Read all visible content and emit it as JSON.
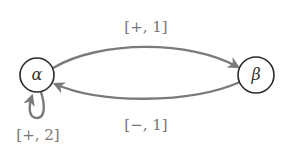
{
  "diagram": {
    "type": "state-transition",
    "nodes": [
      {
        "id": "alpha",
        "label": "α"
      },
      {
        "id": "beta",
        "label": "β"
      }
    ],
    "edges": [
      {
        "from": "alpha",
        "to": "beta",
        "label": "[+, 1]"
      },
      {
        "from": "beta",
        "to": "alpha",
        "label": "[−, 1]"
      },
      {
        "from": "alpha",
        "to": "alpha",
        "label": "[+, 2]"
      }
    ],
    "colors": {
      "node_stroke": "#2a2a2a",
      "edge_stroke": "#7a7a7a",
      "label_text": "#777777"
    }
  }
}
